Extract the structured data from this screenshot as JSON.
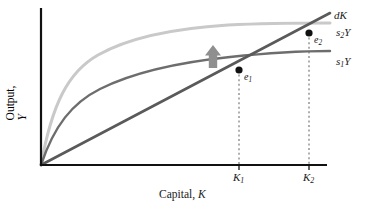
{
  "figure": {
    "background": "#ffffff"
  },
  "axes": {
    "x_title_prefix": "Capital, ",
    "x_title_var": "K",
    "y_title_prefix": "Output, ",
    "y_title_var": "Y",
    "origin": {
      "x": 41,
      "y": 165
    },
    "x_end": {
      "x": 327,
      "y": 165
    },
    "y_top": {
      "x": 41,
      "y": 8
    },
    "axis_color": "#111111",
    "axis_width": 2.2
  },
  "ticks": {
    "x": [
      {
        "name": "K1",
        "label_prefix": "K",
        "label_sub": "1",
        "px": 239
      },
      {
        "name": "K2",
        "label_prefix": "K",
        "label_sub": "2",
        "px": 309
      }
    ]
  },
  "curves": {
    "dK": {
      "label_text": "dK",
      "color": "#5a5a5a",
      "width": 2.6,
      "kind": "line",
      "label_x": 334,
      "label_y": 11
    },
    "s1Y": {
      "label_prefix": "s",
      "label_sub": "1",
      "label_suffix": "Y",
      "color": "#6d6d6d",
      "width": 2.4,
      "kind": "concave-curve",
      "label_x": 336,
      "label_y": 58
    },
    "s2Y": {
      "label_prefix": "s",
      "label_sub": "2",
      "label_suffix": "Y",
      "color": "#c9c9c9",
      "width": 3.0,
      "kind": "concave-curve",
      "label_x": 336,
      "label_y": 28
    }
  },
  "points": [
    {
      "name": "e1",
      "label_prefix": "e",
      "label_sub": "1",
      "x": 239,
      "y": 70,
      "label_x": 244,
      "label_y": 74,
      "color": "#111111",
      "radius": 3.6
    },
    {
      "name": "e2",
      "label_prefix": "e",
      "label_sub": "2",
      "x": 309,
      "y": 33,
      "label_x": 314,
      "label_y": 37,
      "color": "#111111",
      "radius": 3.6
    }
  ],
  "guides": {
    "color": "#6d6d6d",
    "dash": "2,2.6",
    "width": 1.1,
    "lines": [
      {
        "name": "guide-K1",
        "x": 239,
        "y_top": 70,
        "y_bottom": 165
      },
      {
        "name": "guide-K2",
        "x": 309,
        "y_top": 33,
        "y_bottom": 165
      }
    ]
  },
  "shift_arrow": {
    "name": "shift-up-arrow",
    "direction": "up",
    "color": "#8f8f8f",
    "x_center": 213,
    "y_top": 46,
    "y_bottom": 68,
    "shaft_half_width": 4.2,
    "head_half_width": 8.0,
    "head_height": 9.5
  }
}
